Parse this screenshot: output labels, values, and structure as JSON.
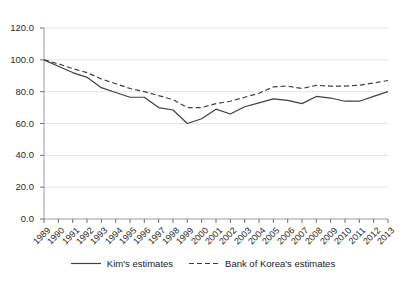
{
  "chart_data": {
    "type": "line",
    "title": "",
    "subtitle": "",
    "xlabel": "",
    "ylabel": "",
    "grid": "horizontal",
    "legend_position": "bottom-center",
    "xlim": [
      1989,
      2013
    ],
    "ylim": [
      0,
      120
    ],
    "ytick_labels": [
      "0.0",
      "20.0",
      "40.0",
      "60.0",
      "80.0",
      "100.0",
      "120.0"
    ],
    "ytick_values": [
      0,
      20,
      40,
      60,
      80,
      100,
      120
    ],
    "categories": [
      "1989",
      "1990",
      "1991",
      "1992",
      "1993",
      "1994",
      "1995",
      "1996",
      "1997",
      "1998",
      "1999",
      "2000",
      "2001",
      "2002",
      "2003",
      "2004",
      "2005",
      "2006",
      "2007",
      "2008",
      "2009",
      "2010",
      "2011",
      "2012",
      "2013"
    ],
    "series": [
      {
        "name": "Kim's estimates",
        "style": "solid",
        "color": "#404040",
        "values": [
          100.0,
          96.0,
          92.0,
          89.0,
          82.5,
          79.5,
          76.5,
          76.5,
          70.0,
          68.5,
          60.0,
          63.0,
          69.0,
          66.0,
          70.5,
          73.0,
          75.5,
          74.5,
          72.5,
          77.0,
          76.0,
          74.0,
          74.0,
          77.0,
          80.0
        ]
      },
      {
        "name": "Bank of Korea's estimates",
        "style": "dashed",
        "color": "#404040",
        "values": [
          100.0,
          97.5,
          94.5,
          92.0,
          88.0,
          85.0,
          82.0,
          80.0,
          77.5,
          75.0,
          70.0,
          70.0,
          72.5,
          74.0,
          76.5,
          79.0,
          83.0,
          83.5,
          82.0,
          84.0,
          83.5,
          83.5,
          84.0,
          85.5,
          87.0
        ]
      }
    ]
  },
  "legend": {
    "entries": [
      {
        "label": "Kim's estimates",
        "style": "solid"
      },
      {
        "label": "Bank of Korea's estimates",
        "style": "dashed"
      }
    ]
  }
}
